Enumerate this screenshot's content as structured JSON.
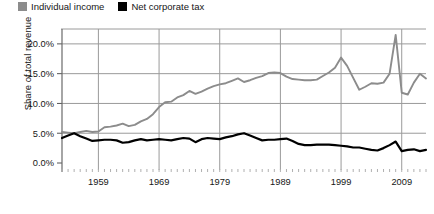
{
  "legend": {
    "position": "top-left",
    "items": [
      {
        "label": "Individual income",
        "color": "#8c8c8c",
        "swatch": "gray-square-icon"
      },
      {
        "label": "Net corporate tax",
        "color": "#000000",
        "swatch": "black-square-icon"
      }
    ]
  },
  "axes": {
    "ylabel": "Share of total revenue",
    "xlabel": "",
    "yticks": [
      "0.0%",
      "5.0%",
      "10.0%",
      "15.0%",
      "20.0%"
    ],
    "xticks": [
      "1959",
      "1969",
      "1979",
      "1989",
      "1999",
      "2009"
    ]
  },
  "chart_data": {
    "type": "line",
    "title": "",
    "subtitle": "",
    "xlabel": "",
    "ylabel": "Share of total revenue",
    "xlim": [
      1953,
      2013
    ],
    "ylim": [
      0,
      22.5
    ],
    "yticks": [
      0,
      5,
      10,
      15,
      20
    ],
    "ytick_labels": [
      "0.0%",
      "5.0%",
      "10.0%",
      "15.0%",
      "20.0%"
    ],
    "xticks": [
      1959,
      1969,
      1979,
      1989,
      1999,
      2009
    ],
    "grid": "both",
    "legend_position": "above-plot-left",
    "x": [
      1953,
      1954,
      1955,
      1956,
      1957,
      1958,
      1959,
      1960,
      1961,
      1962,
      1963,
      1964,
      1965,
      1966,
      1967,
      1968,
      1969,
      1970,
      1971,
      1972,
      1973,
      1974,
      1975,
      1976,
      1977,
      1978,
      1979,
      1980,
      1981,
      1982,
      1983,
      1984,
      1985,
      1986,
      1987,
      1988,
      1989,
      1990,
      1991,
      1992,
      1993,
      1994,
      1995,
      1996,
      1997,
      1998,
      1999,
      2000,
      2001,
      2002,
      2003,
      2004,
      2005,
      2006,
      2007,
      2008,
      2009,
      2010,
      2011,
      2012,
      2013
    ],
    "series": [
      {
        "name": "Individual income",
        "color": "#8c8c8c",
        "values": [
          5.2,
          5.1,
          5.0,
          5.2,
          5.4,
          5.2,
          5.3,
          6.0,
          6.1,
          6.3,
          6.6,
          6.2,
          6.4,
          7.0,
          7.4,
          8.2,
          9.4,
          10.2,
          10.3,
          11.0,
          11.4,
          12.1,
          11.6,
          12.0,
          12.5,
          12.9,
          13.2,
          13.4,
          13.8,
          14.2,
          13.6,
          13.9,
          14.3,
          14.6,
          15.1,
          15.2,
          15.1,
          14.5,
          14.1,
          14.0,
          13.9,
          13.9,
          14.0,
          14.6,
          15.2,
          16.0,
          17.7,
          16.3,
          14.3,
          12.3,
          12.8,
          13.4,
          13.3,
          13.5,
          15.0,
          21.5,
          11.8,
          11.5,
          13.5,
          15.0,
          14.2
        ],
        "annotations": [
          {
            "x": 2000,
            "y": 17.7,
            "note": "dot-com peak"
          },
          {
            "x": 2008,
            "y": 21.5,
            "note": "spike"
          }
        ]
      },
      {
        "name": "Net corporate tax",
        "color": "#000000",
        "values": [
          4.2,
          4.6,
          5.0,
          4.5,
          4.1,
          3.7,
          3.8,
          3.9,
          3.9,
          3.8,
          3.4,
          3.5,
          3.8,
          4.0,
          3.8,
          3.9,
          4.0,
          3.9,
          3.8,
          4.0,
          4.2,
          4.1,
          3.5,
          4.0,
          4.2,
          4.1,
          4.0,
          4.3,
          4.5,
          4.8,
          5.0,
          4.6,
          4.2,
          3.8,
          3.9,
          3.9,
          4.0,
          4.1,
          3.7,
          3.2,
          3.0,
          3.0,
          3.1,
          3.1,
          3.1,
          3.0,
          2.9,
          2.8,
          2.6,
          2.6,
          2.4,
          2.2,
          2.1,
          2.5,
          3.0,
          3.6,
          2.0,
          2.2,
          2.3,
          2.0,
          2.2
        ]
      }
    ]
  }
}
